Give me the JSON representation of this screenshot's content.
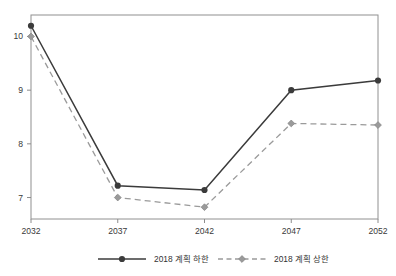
{
  "chart_data": {
    "type": "line",
    "title": "",
    "subtitle": "",
    "xlabel": "",
    "ylabel": "",
    "categories": [
      "2032",
      "2037",
      "2042",
      "2047",
      "2052"
    ],
    "x": [
      2032,
      2037,
      2042,
      2047,
      2052
    ],
    "xlim": [
      2032,
      2052
    ],
    "ylim": [
      6.6,
      10.4
    ],
    "yticks": [
      "7",
      "8",
      "9",
      "10"
    ],
    "ytick_values": [
      7,
      8,
      9,
      10
    ],
    "grid": false,
    "legend_position": "bottom",
    "series": [
      {
        "name": "2018 계획 하한",
        "values": [
          10.2,
          7.22,
          7.14,
          9.0,
          9.18
        ],
        "color": "#3b3b3b",
        "style": "solid",
        "marker": "circle"
      },
      {
        "name": "2018 계획 상한",
        "values": [
          10.0,
          7.0,
          6.82,
          8.38,
          8.35
        ],
        "color": "#9a9a9a",
        "style": "dashed",
        "marker": "diamond"
      }
    ]
  },
  "axes": {
    "y_tick_labels": [
      "10",
      "9",
      "8",
      "7"
    ],
    "x_tick_labels": [
      "2032",
      "2037",
      "2042",
      "2047",
      "2052"
    ]
  },
  "legend": {
    "items": [
      {
        "label": "2018 계획 하한",
        "color": "#3b3b3b",
        "style": "solid"
      },
      {
        "label": "2018 계획 상한",
        "color": "#9a9a9a",
        "style": "dashed"
      }
    ]
  },
  "colors": {
    "lower_bound": "#3b3b3b",
    "upper_bound": "#9a9a9a",
    "axis": "#8c8c8c",
    "text": "#333333",
    "background": "#ffffff"
  }
}
